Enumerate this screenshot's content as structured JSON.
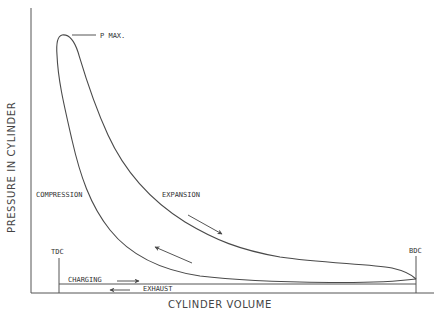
{
  "diagram": {
    "type": "pressure-volume indicator diagram",
    "axes": {
      "y_label": "PRESSURE IN CYLINDER",
      "x_label": "CYLINDER VOLUME"
    },
    "labels": {
      "p_max": "P MAX.",
      "compression": "COMPRESSION",
      "expansion": "EXPANSION",
      "tdc": "TDC",
      "bdc": "BDC",
      "charging": "CHARGING",
      "exhaust": "EXHAUST"
    },
    "arrows": {
      "expansion": "down-right",
      "compression": "up-left",
      "charging": "right",
      "exhaust": "left"
    },
    "colors": {
      "line": "#4a4a4a",
      "text": "#333333",
      "background": "#ffffff"
    }
  }
}
